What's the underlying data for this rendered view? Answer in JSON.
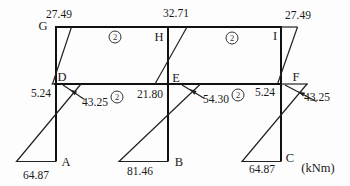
{
  "figure": {
    "unit": "(kNm)",
    "stiffness": "2",
    "joints": {
      "G": "G",
      "H": "H",
      "I": "I",
      "D": "D",
      "E": "E",
      "F": "F",
      "A": "A",
      "B": "B",
      "C": "C"
    },
    "moments": {
      "G_top": "27.49",
      "H_top": "32.71",
      "I_top": "27.49",
      "D_upper_col": "5.24",
      "E_upper_col": "21.80",
      "F_upper_col": "5.24",
      "D_lower_col": "43.25",
      "E_lower_col": "54.30",
      "F_lower_col": "43.25",
      "A_base": "64.87",
      "B_base": "81.46",
      "C_base": "64.87"
    }
  }
}
